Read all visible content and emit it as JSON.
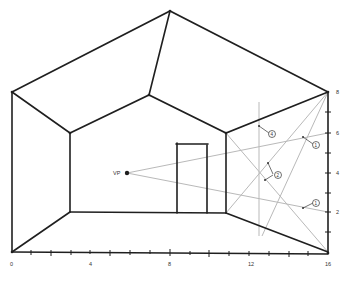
{
  "diagram": {
    "type": "one-point perspective room sketch",
    "vanishing_point": {
      "label": "VP"
    },
    "x_axis": {
      "tick_labels": [
        "0",
        "4",
        "8",
        "12",
        "16"
      ]
    },
    "y_axis": {
      "tick_labels": [
        "2",
        "4",
        "6",
        "8"
      ]
    },
    "callouts": [
      {
        "label": "4"
      },
      {
        "label": "1"
      },
      {
        "label": "2"
      },
      {
        "label": "1"
      }
    ],
    "colors": {
      "ink": "#1f1f1f",
      "construction_lines": "#b9b9b9"
    }
  }
}
